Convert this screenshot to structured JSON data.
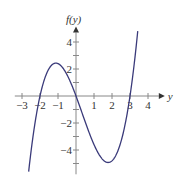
{
  "chart_data": {
    "type": "line",
    "title": "",
    "xlabel": "y",
    "ylabel": "f(y)",
    "xlim": [
      -3.4,
      4.6
    ],
    "ylim": [
      -5.6,
      4.8
    ],
    "x_ticks": [
      -3,
      -2,
      -1,
      1,
      2,
      3,
      4
    ],
    "y_ticks": [
      -4,
      -2,
      2,
      4
    ],
    "x_tick_labels": [
      "−3",
      "−2",
      "−1",
      "1",
      "2",
      "3",
      "4"
    ],
    "y_tick_labels": [
      "−4",
      "−2",
      "2",
      "4"
    ],
    "grid": false,
    "series": [
      {
        "name": "f(y)",
        "function": "0.6*y*(y+2)*(y-3)",
        "roots": [
          -2,
          0,
          3
        ],
        "local_max": {
          "x": -1.1,
          "y": 2.4
        },
        "local_min": {
          "x": 1.8,
          "y": -4.9
        },
        "color": "#3a3a7a"
      }
    ]
  },
  "axis": {
    "x_label": "y",
    "y_label": "f(y)"
  }
}
